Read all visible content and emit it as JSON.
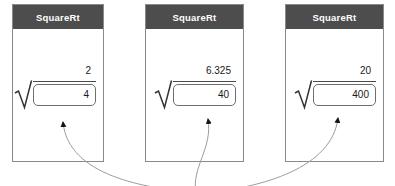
{
  "windows": [
    {
      "title": "SquareRt",
      "result": "2",
      "input": "4"
    },
    {
      "title": "SquareRt",
      "result": "6.325",
      "input": "40"
    },
    {
      "title": "SquareRt",
      "result": "20",
      "input": "400"
    }
  ],
  "icons": {
    "radical": "square-root-radical-sign",
    "arrow": "curved-annotation-arrow"
  },
  "colors": {
    "titlebar": "#4d4d4d",
    "titlebar_text": "#ffffff",
    "window_border": "#8a8a8a",
    "box_border": "#6e6e6e",
    "text": "#1a1a1a",
    "arrow_line": "#9c9c9c",
    "arrow_head": "#141414",
    "background": "#ffffff"
  }
}
